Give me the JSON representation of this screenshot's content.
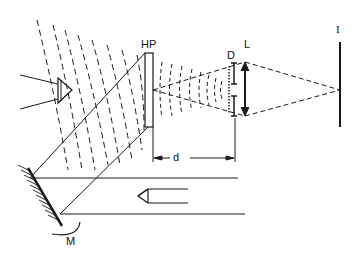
{
  "diagram": {
    "type": "holographic reconstruction setup",
    "labels": {
      "hologram": "HP",
      "diffuser": "D",
      "lens": "L",
      "image_plane": "I",
      "distance": "d",
      "mirror": "M"
    },
    "colors": {
      "ink": "#1a1a1a",
      "background": "#ffffff"
    }
  }
}
